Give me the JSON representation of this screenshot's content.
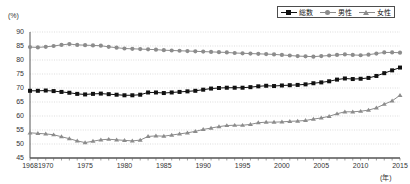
{
  "axes": {
    "y_unit": "(%)",
    "x_unit": "(年)",
    "y_ticks": [
      "90",
      "85",
      "80",
      "75",
      "70",
      "65",
      "60",
      "55",
      "50",
      "45"
    ],
    "x_ticks": [
      "1968",
      "1970",
      "1975",
      "1980",
      "1985",
      "1990",
      "1995",
      "2000",
      "2005",
      "2010",
      "2015"
    ]
  },
  "legend": {
    "items": [
      {
        "label": "総数",
        "marker": "square-marker",
        "color": "#111111"
      },
      {
        "label": "男性",
        "marker": "circle-marker",
        "color": "#8c8c8c"
      },
      {
        "label": "女性",
        "marker": "triangle-marker",
        "color": "#8c8c8c"
      }
    ]
  },
  "chart_data": {
    "type": "line",
    "title": "",
    "subtitle": "",
    "xlabel": "(年)",
    "ylabel": "(%)",
    "xlim": [
      1968,
      2015
    ],
    "ylim": [
      45,
      90
    ],
    "ytick_step": 5,
    "grid": true,
    "legend_position": "top-right",
    "x": [
      1968,
      1969,
      1970,
      1971,
      1972,
      1973,
      1974,
      1975,
      1976,
      1977,
      1978,
      1979,
      1980,
      1981,
      1982,
      1983,
      1984,
      1985,
      1986,
      1987,
      1988,
      1989,
      1990,
      1991,
      1992,
      1993,
      1994,
      1995,
      1996,
      1997,
      1998,
      1999,
      2000,
      2001,
      2002,
      2003,
      2004,
      2005,
      2006,
      2007,
      2008,
      2009,
      2010,
      2011,
      2012,
      2013,
      2014,
      2015
    ],
    "series": [
      {
        "name": "総数",
        "marker": "square-marker",
        "color": "#111111",
        "values": [
          69.0,
          69.0,
          69.1,
          68.9,
          68.6,
          68.3,
          67.9,
          67.7,
          67.9,
          68.0,
          67.8,
          67.6,
          67.4,
          67.4,
          67.6,
          68.4,
          68.4,
          68.2,
          68.4,
          68.6,
          68.8,
          69.0,
          69.4,
          69.8,
          70.0,
          70.1,
          70.1,
          70.1,
          70.3,
          70.6,
          70.8,
          70.7,
          70.9,
          71.0,
          71.1,
          71.3,
          71.7,
          72.0,
          72.4,
          73.0,
          73.4,
          73.2,
          73.3,
          73.6,
          74.3,
          75.3,
          76.3,
          77.3
        ],
        "marker_size": 4
      },
      {
        "name": "男性",
        "marker": "circle-marker",
        "color": "#8c8c8c",
        "values": [
          84.6,
          84.5,
          84.7,
          85.0,
          85.4,
          85.7,
          85.4,
          85.3,
          85.2,
          85.1,
          84.7,
          84.4,
          84.1,
          84.0,
          83.9,
          83.8,
          83.7,
          83.5,
          83.4,
          83.3,
          83.2,
          83.1,
          83.0,
          82.9,
          82.8,
          82.7,
          82.5,
          82.4,
          82.3,
          82.2,
          82.1,
          82.0,
          81.8,
          81.6,
          81.4,
          81.3,
          81.2,
          81.4,
          81.6,
          81.8,
          82.0,
          81.8,
          81.7,
          81.9,
          82.3,
          82.7,
          82.7,
          82.6
        ],
        "marker_size": 4
      },
      {
        "name": "女性",
        "marker": "triangle-marker",
        "color": "#8c8c8c",
        "values": [
          54.0,
          53.8,
          53.6,
          53.3,
          52.6,
          51.9,
          51.1,
          50.5,
          51.0,
          51.5,
          51.7,
          51.5,
          51.3,
          51.1,
          51.4,
          52.7,
          52.9,
          52.8,
          53.2,
          53.6,
          54.0,
          54.5,
          55.2,
          55.7,
          56.2,
          56.6,
          56.7,
          56.7,
          57.0,
          57.6,
          57.8,
          57.8,
          57.9,
          58.1,
          58.2,
          58.4,
          58.9,
          59.3,
          59.9,
          60.8,
          61.5,
          61.5,
          61.7,
          62.1,
          62.9,
          64.2,
          65.4,
          67.4
        ],
        "marker_size": 4
      }
    ]
  }
}
